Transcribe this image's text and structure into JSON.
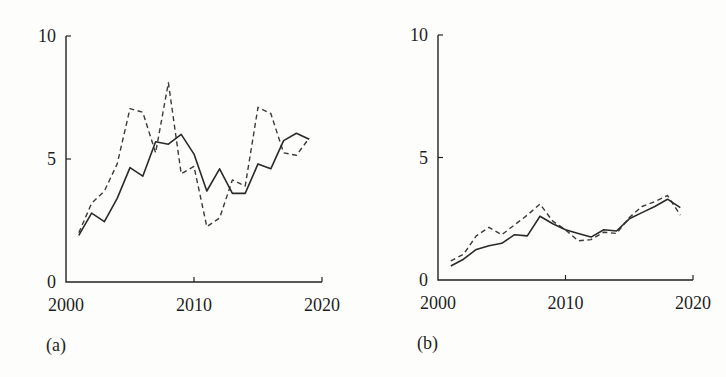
{
  "chart_data": [
    {
      "type": "line",
      "panel_label": "(a)",
      "title": "",
      "xlabel": "",
      "ylabel": "",
      "xlim": [
        2000,
        2020
      ],
      "ylim": [
        0,
        10
      ],
      "x_ticks": [
        2000,
        2010,
        2020
      ],
      "y_ticks": [
        0,
        5,
        10
      ],
      "grid": false,
      "legend": null,
      "x": [
        2001,
        2002,
        2003,
        2004,
        2005,
        2006,
        2007,
        2008,
        2009,
        2010,
        2011,
        2012,
        2013,
        2014,
        2015,
        2016,
        2017,
        2018,
        2019
      ],
      "series": [
        {
          "name": "solid",
          "style": "solid",
          "values": [
            1.9,
            2.8,
            2.45,
            3.4,
            4.65,
            4.3,
            5.7,
            5.6,
            6.0,
            5.2,
            3.7,
            4.6,
            3.6,
            3.6,
            4.8,
            4.6,
            5.75,
            6.05,
            5.8
          ]
        },
        {
          "name": "dashed",
          "style": "dashed",
          "values": [
            2.0,
            3.2,
            3.7,
            4.8,
            7.05,
            6.9,
            5.25,
            8.1,
            4.4,
            4.7,
            2.25,
            2.6,
            4.15,
            3.9,
            7.1,
            6.85,
            5.25,
            5.15,
            5.85
          ]
        }
      ]
    },
    {
      "type": "line",
      "panel_label": "(b)",
      "title": "",
      "xlabel": "",
      "ylabel": "",
      "xlim": [
        2000,
        2020
      ],
      "ylim": [
        0,
        10
      ],
      "x_ticks": [
        2000,
        2010,
        2020
      ],
      "y_ticks": [
        0,
        5,
        10
      ],
      "grid": false,
      "legend": null,
      "x": [
        2001,
        2002,
        2003,
        2004,
        2005,
        2006,
        2007,
        2008,
        2009,
        2010,
        2011,
        2012,
        2013,
        2014,
        2015,
        2016,
        2017,
        2018,
        2019
      ],
      "series": [
        {
          "name": "solid",
          "style": "solid",
          "values": [
            0.57,
            0.85,
            1.25,
            1.4,
            1.5,
            1.85,
            1.8,
            2.6,
            2.3,
            2.05,
            1.9,
            1.75,
            2.05,
            2.0,
            2.5,
            2.75,
            3.0,
            3.3,
            2.95
          ]
        },
        {
          "name": "dashed",
          "style": "dashed",
          "values": [
            0.78,
            1.05,
            1.8,
            2.15,
            1.85,
            2.25,
            2.65,
            3.1,
            2.4,
            2.05,
            1.6,
            1.65,
            1.95,
            1.9,
            2.55,
            3.0,
            3.2,
            3.45,
            2.65
          ]
        }
      ]
    }
  ],
  "panels": [
    {
      "label": "(a)",
      "y_tick_labels": [
        "0",
        "5",
        "10"
      ],
      "x_tick_labels": [
        "2000",
        "2010",
        "2020"
      ]
    },
    {
      "label": "(b)",
      "y_tick_labels": [
        "0",
        "5",
        "10"
      ],
      "x_tick_labels": [
        "2000",
        "2010",
        "2020"
      ]
    }
  ]
}
